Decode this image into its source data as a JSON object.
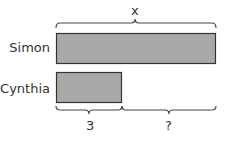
{
  "diagram": {
    "top_label": "x",
    "rows": [
      {
        "name": "Simon",
        "length": 160
      },
      {
        "name": "Cynthia",
        "length": 66
      }
    ],
    "bottom_labels": {
      "known": "3",
      "unknown": "?"
    },
    "colors": {
      "bar_fill": "#a9a9a9",
      "bar_stroke": "#333333",
      "brace": "#444444",
      "text": "#333333"
    }
  }
}
